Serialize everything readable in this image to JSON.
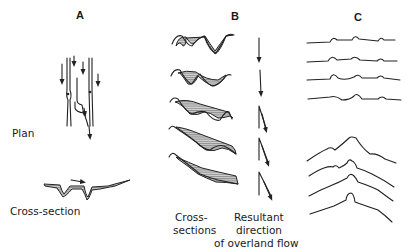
{
  "panels": {
    "a": {
      "letter": "A",
      "plan_label": "Plan",
      "cross_section_label": "Cross-section"
    },
    "b": {
      "letter": "B",
      "cross_sections_label_line1": "Cross-",
      "cross_sections_label_line2": "sections",
      "direction_label_line1": "Resultant",
      "direction_label_line2": "direction",
      "direction_label_line3": "of overland flow"
    },
    "c": {
      "letter": "C"
    }
  },
  "colors": {
    "ink": "#222222",
    "background": "#ffffff",
    "hatch": "#9a9a9a"
  }
}
